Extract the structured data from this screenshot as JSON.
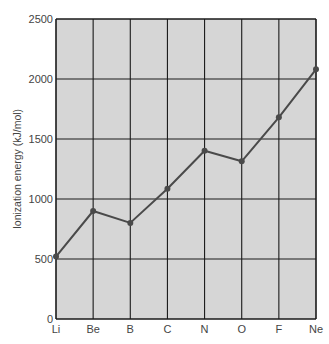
{
  "chart_data": {
    "type": "line",
    "title": "",
    "xlabel": "",
    "ylabel": "Ionization energy (kJ/mol)",
    "categories": [
      "Li",
      "Be",
      "B",
      "C",
      "N",
      "O",
      "F",
      "Ne"
    ],
    "series": [
      {
        "name": "First ionization energy",
        "values": [
          520,
          900,
          801,
          1086,
          1402,
          1314,
          1681,
          2081
        ]
      }
    ],
    "ylim": [
      0,
      2500
    ],
    "yticks": [
      0,
      500,
      1000,
      1500,
      2000,
      2500
    ],
    "grid": true,
    "legend": "none"
  },
  "colors": {
    "plot_background": "#d6d6d6",
    "grid": "#1a1a1a",
    "line": "#4a4a4a",
    "marker": "#4a4a4a"
  }
}
